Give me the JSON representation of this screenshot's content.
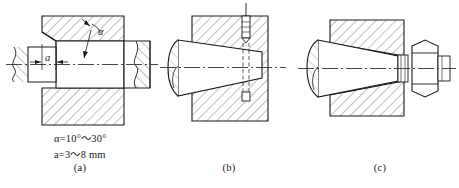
{
  "figure": {
    "background_color": "#ffffff",
    "line_color": "#1a1a1a",
    "hatch_color": "#4a4a4a",
    "centerline_color": "#333333"
  },
  "panels": [
    {
      "id": "a",
      "caption": "(a)",
      "kind": "cylindrical-shaft-with-chamfer",
      "labels": {
        "angle_symbol": "α",
        "dimension_symbol": "a"
      }
    },
    {
      "id": "b",
      "caption": "(b)",
      "kind": "tapered-shaft-with-set-screw"
    },
    {
      "id": "c",
      "caption": "(c)",
      "kind": "tapered-shaft-with-washer-and-hex-nut"
    }
  ],
  "notes": [
    {
      "text": "α=10°～30°"
    },
    {
      "text": "a=3～8 mm"
    }
  ]
}
